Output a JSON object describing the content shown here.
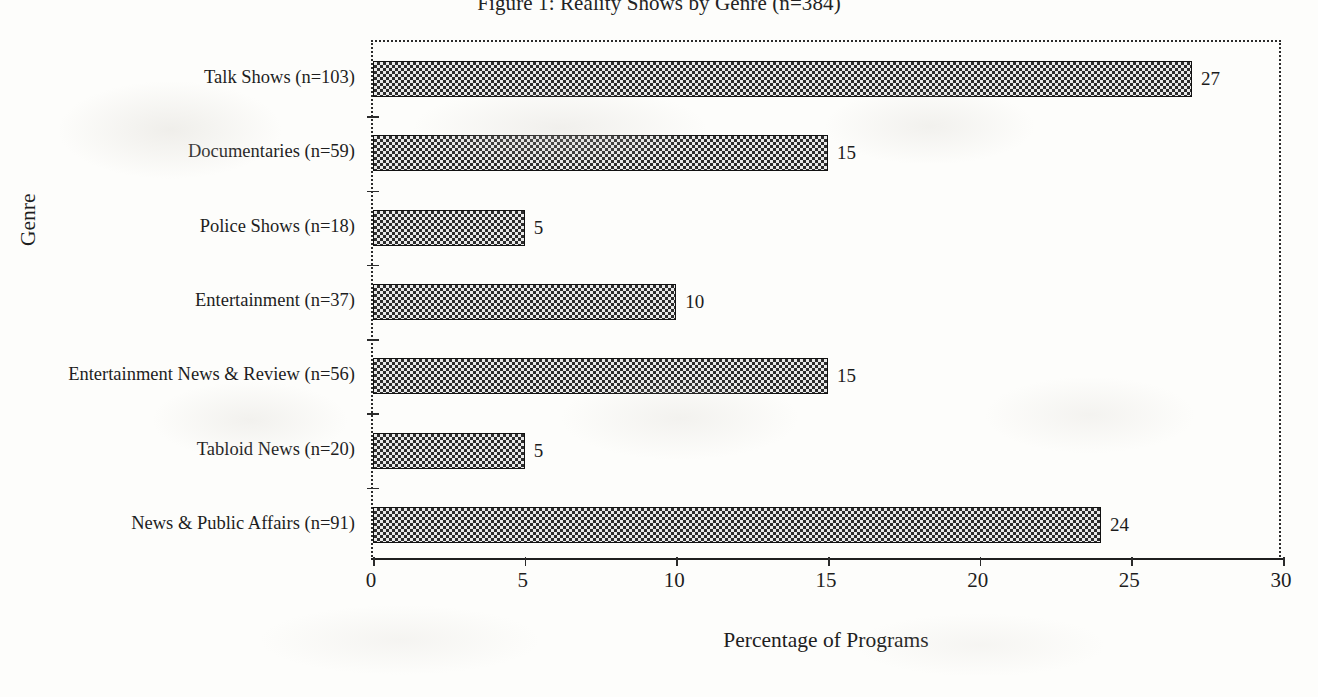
{
  "figure": {
    "title": "Figure 1: Reality Shows by Genre (n=384)",
    "x_axis_title": "Percentage of Programs",
    "y_axis_title": "Genre"
  },
  "chart_data": {
    "type": "bar",
    "orientation": "horizontal",
    "title": "Figure 1: Reality Shows by Genre (n=384)",
    "xlabel": "Percentage of Programs",
    "ylabel": "Genre",
    "xlim": [
      0,
      30
    ],
    "xticks": [
      "0",
      "5",
      "10",
      "15",
      "20",
      "25",
      "30"
    ],
    "grid": false,
    "legend": null,
    "bar_fill": "checkered-hatch-dark-gray",
    "bar_edge_color": "#111111",
    "categories": [
      "Talk Shows (n=103)",
      "Documentaries (n=59)",
      "Police Shows (n=18)",
      "Entertainment (n=37)",
      "Entertainment News & Review (n=56)",
      "Tabloid News (n=20)",
      "News & Public Affairs (n=91)"
    ],
    "values": [
      27,
      15,
      5,
      10,
      15,
      5,
      24
    ],
    "value_labels": [
      "27",
      "15",
      "5",
      "10",
      "15",
      "5",
      "24"
    ],
    "category_counts": [
      103,
      59,
      18,
      37,
      56,
      20,
      91
    ],
    "total_n": 384
  }
}
